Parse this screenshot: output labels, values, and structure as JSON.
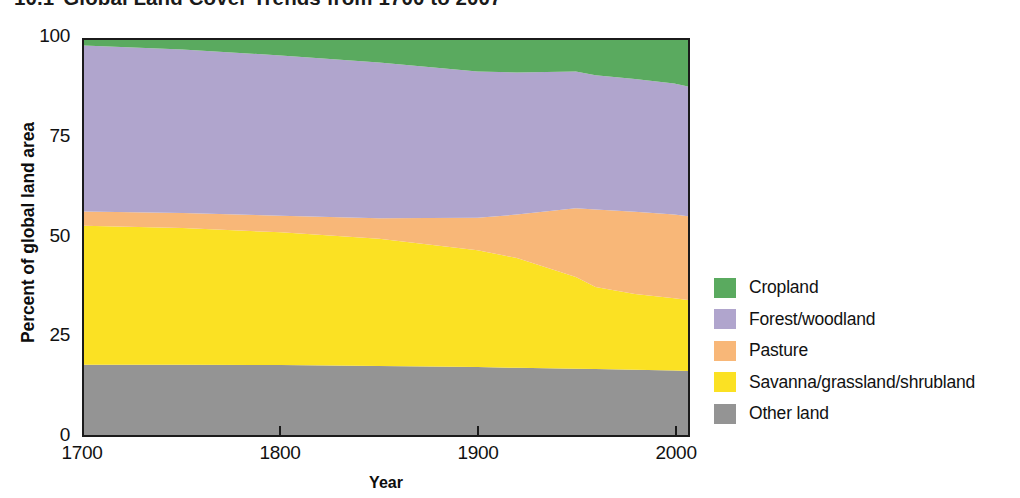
{
  "title": {
    "number": "10.1",
    "text": "Global Land Cover Trends from 1700 to 2007"
  },
  "axes": {
    "y_title": "Percent of global land area",
    "x_title": "Year",
    "y_ticks": [
      "0",
      "25",
      "50",
      "75",
      "100"
    ],
    "x_ticks": [
      "1700",
      "1800",
      "1900",
      "2000"
    ]
  },
  "legend": {
    "items": [
      {
        "label": "Cropland",
        "color": "#5aaa5f"
      },
      {
        "label": "Forest/woodland",
        "color": "#b0a5cd"
      },
      {
        "label": "Pasture",
        "color": "#f8b778"
      },
      {
        "label": "Savanna/grassland/shrubland",
        "color": "#fbe123"
      },
      {
        "label": "Other land",
        "color": "#949494"
      }
    ]
  },
  "chart_data": {
    "type": "area",
    "stacked": true,
    "normalized_total": 100,
    "xlabel": "Year",
    "ylabel": "Percent of global land area",
    "xlim": [
      1700,
      2007
    ],
    "ylim": [
      0,
      100
    ],
    "xticks": [
      1700,
      1800,
      1900,
      2000
    ],
    "yticks": [
      0,
      25,
      50,
      75,
      100
    ],
    "grid": false,
    "legend_position": "right",
    "x": [
      1700,
      1750,
      1800,
      1850,
      1900,
      1920,
      1950,
      1960,
      1980,
      2000,
      2007
    ],
    "series": [
      {
        "name": "Other land",
        "color": "#949494",
        "stack_order": 1,
        "values": [
          17.8,
          17.8,
          17.7,
          17.5,
          17.2,
          17.0,
          16.8,
          16.7,
          16.5,
          16.3,
          16.2
        ]
      },
      {
        "name": "Savanna/grassland/shrubland",
        "color": "#fbe123",
        "stack_order": 2,
        "values": [
          35.2,
          34.6,
          33.6,
          32.2,
          29.6,
          27.8,
          23.2,
          20.8,
          19.2,
          18.3,
          18.0
        ]
      },
      {
        "name": "Pasture",
        "color": "#f8b778",
        "stack_order": 3,
        "values": [
          3.6,
          3.8,
          4.2,
          5.2,
          8.2,
          11.0,
          17.4,
          19.6,
          20.8,
          21.2,
          21.2
        ]
      },
      {
        "name": "Forest/woodland",
        "color": "#b0a5cd",
        "stack_order": 4,
        "values": [
          42.0,
          41.4,
          40.6,
          39.4,
          37.0,
          36.0,
          34.6,
          34.0,
          33.6,
          33.2,
          32.8
        ]
      },
      {
        "name": "Cropland",
        "color": "#5aaa5f",
        "stack_order": 5,
        "values": [
          1.4,
          2.4,
          3.9,
          5.7,
          8.0,
          8.2,
          8.0,
          8.9,
          9.9,
          11.0,
          11.8
        ]
      }
    ]
  }
}
